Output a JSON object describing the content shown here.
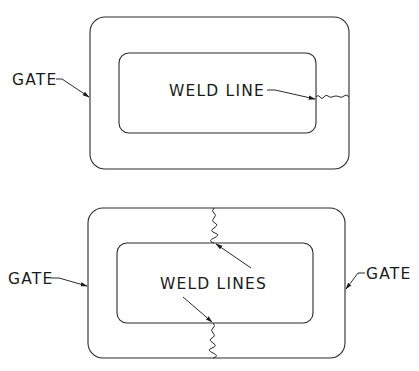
{
  "figures": [
    {
      "id": "single-gate",
      "labels": {
        "gate_left": "GATE",
        "weld": "WELD LINE"
      }
    },
    {
      "id": "double-gate",
      "labels": {
        "gate_left": "GATE",
        "gate_right": "GATE",
        "weld": "WELD LINES"
      }
    }
  ],
  "colors": {
    "line": "#2a2a2a",
    "text": "#1a1a1a",
    "background": "#ffffff"
  }
}
